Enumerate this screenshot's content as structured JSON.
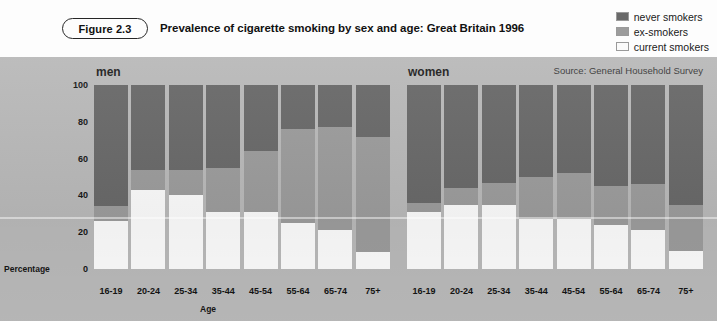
{
  "figure": {
    "badge": "Figure 2.3",
    "title": "Prevalence of cigarette smoking by sex and age: Great Britain 1996"
  },
  "legend": {
    "items": [
      {
        "label": "never smokers",
        "color": "#696969"
      },
      {
        "label": "ex-smokers",
        "color": "#9c9c9c"
      },
      {
        "label": "current smokers",
        "color": "#fbfbfb"
      }
    ]
  },
  "source_note": "Source: General Household Survey",
  "groups": [
    {
      "key": "men",
      "title": "men"
    },
    {
      "key": "women",
      "title": "women"
    }
  ],
  "axes": {
    "ylabel": "Percentage",
    "xlabel": "Age",
    "yticks": [
      "0",
      "20",
      "40",
      "60",
      "80",
      "100"
    ],
    "ylim": [
      0,
      100
    ]
  },
  "chart_data": {
    "type": "bar",
    "stacked": true,
    "percent": true,
    "title": "Prevalence of cigarette smoking by sex and age: Great Britain 1996",
    "subtitle": "Source: General Household Survey",
    "xlabel": "Age",
    "ylabel": "Percentage",
    "ylim": [
      0,
      100
    ],
    "yticks": [
      0,
      20,
      40,
      60,
      80,
      100
    ],
    "grid": false,
    "legend_position": "top-right",
    "categories": [
      "16-19",
      "20-24",
      "25-34",
      "35-44",
      "45-54",
      "55-64",
      "65-74",
      "75+"
    ],
    "panels": [
      {
        "name": "men",
        "series": [
          {
            "name": "current smokers",
            "color": "#fbfbfb",
            "values": [
              26,
              43,
              40,
              31,
              31,
              25,
              21,
              9
            ]
          },
          {
            "name": "ex-smokers",
            "color": "#9c9c9c",
            "values": [
              8,
              11,
              14,
              24,
              33,
              51,
              56,
              63
            ]
          },
          {
            "name": "never smokers",
            "color": "#696969",
            "values": [
              66,
              46,
              46,
              45,
              36,
              24,
              23,
              28
            ]
          }
        ]
      },
      {
        "name": "women",
        "series": [
          {
            "name": "current smokers",
            "color": "#fbfbfb",
            "values": [
              31,
              35,
              35,
              27,
              27,
              24,
              21,
              10
            ]
          },
          {
            "name": "ex-smokers",
            "color": "#9c9c9c",
            "values": [
              5,
              9,
              12,
              23,
              25,
              21,
              25,
              25
            ]
          },
          {
            "name": "never smokers",
            "color": "#696969",
            "values": [
              64,
              56,
              53,
              50,
              48,
              55,
              54,
              65
            ]
          }
        ]
      }
    ]
  }
}
